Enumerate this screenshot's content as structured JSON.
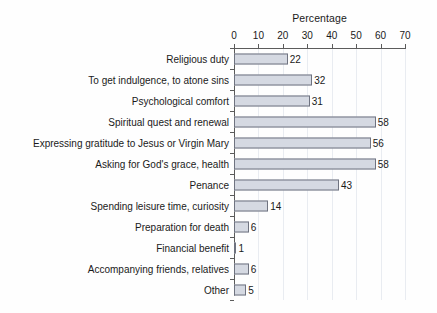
{
  "chart_data": {
    "type": "bar",
    "orientation": "horizontal",
    "title": "Percentage",
    "xlabel": "Percentage",
    "ylabel": "",
    "xlim": [
      0,
      70
    ],
    "xticks": [
      0,
      10,
      20,
      30,
      40,
      50,
      60,
      70
    ],
    "grid": true,
    "legend": false,
    "categories": [
      "Religious duty",
      "To get indulgence, to atone sins",
      "Psychological comfort",
      "Spiritual quest and renewal",
      "Expressing gratitude to Jesus or Virgin Mary",
      "Asking for God's grace, health",
      "Penance",
      "Spending leisure time, curiosity",
      "Preparation for death",
      "Financial benefit",
      "Accompanying friends, relatives",
      "Other"
    ],
    "values": [
      22,
      32,
      31,
      58,
      56,
      58,
      43,
      14,
      6,
      1,
      6,
      5
    ],
    "colors": {
      "bar_fill": "#d5d9e2",
      "bar_border": "#6f7380",
      "axis": "#5b5b5b",
      "grid": "#e9ecf1",
      "text": "#1a1a1a",
      "background": "#fefefe"
    }
  }
}
